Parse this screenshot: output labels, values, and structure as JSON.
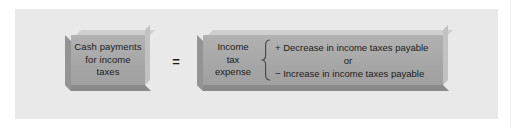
{
  "figure": {
    "panel_color": "#e9e9e9",
    "box_color": "#a9a9a9",
    "text_color": "#1c1c1c"
  },
  "left_box": {
    "name": "cash-payments-box",
    "line1": "Cash payments",
    "line2": "for income",
    "line3": "taxes"
  },
  "operator": {
    "equals": "="
  },
  "right_box": {
    "name": "income-tax-expense-box",
    "line1": "Income",
    "line2": "tax",
    "line3": "expense",
    "brace": "{",
    "option_add": "+ Decrease in income taxes payable",
    "option_or": "or",
    "option_subtract": "− Increase in income taxes payable"
  }
}
